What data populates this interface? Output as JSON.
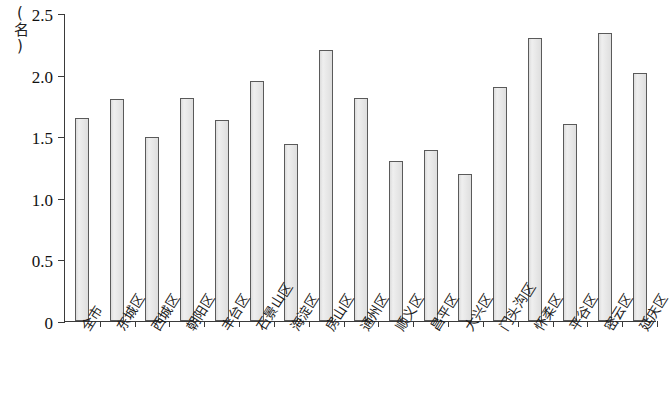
{
  "chart_data": {
    "type": "bar",
    "title": "",
    "xlabel": "",
    "ylabel": "(名)",
    "ylim": [
      0,
      2.5
    ],
    "ytick_labels": [
      "0",
      "0.5",
      "1.0",
      "1.5",
      "2.0",
      "2.5"
    ],
    "ytick_values": [
      0,
      0.5,
      1.0,
      1.5,
      2.0,
      2.5
    ],
    "grid": false,
    "legend": null,
    "categories": [
      "全市",
      "东城区",
      "西城区",
      "朝阳区",
      "丰台区",
      "石景山区",
      "海淀区",
      "房山区",
      "通州区",
      "顺义区",
      "昌平区",
      "大兴区",
      "门头沟区",
      "怀柔区",
      "平谷区",
      "密云区",
      "延庆区"
    ],
    "values": [
      1.65,
      1.8,
      1.49,
      1.81,
      1.63,
      1.95,
      1.44,
      2.2,
      1.81,
      1.3,
      1.39,
      1.19,
      1.9,
      2.3,
      1.6,
      2.34,
      2.01
    ],
    "bar_fill_color": "#e9e9e9",
    "bar_border_color": "#5a5a5a",
    "axis_color": "#3a3a3a"
  }
}
